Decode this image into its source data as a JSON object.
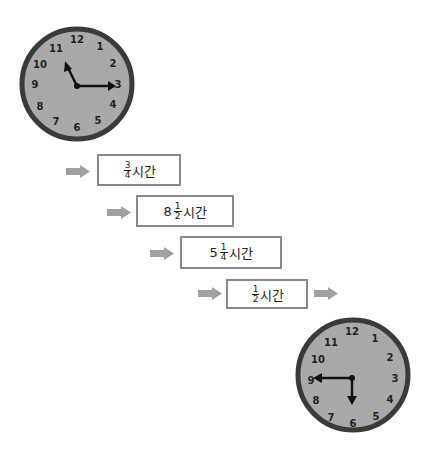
{
  "header": {
    "partial_text": "• •••• •••• ••• ••• ••••• ••••"
  },
  "colors": {
    "clock_face": "#a9a9a9",
    "clock_border": "#3a3a3a",
    "hand": "#111111",
    "arrow": "#a0a0a0",
    "box_border": "#8a8a8a"
  },
  "start_clock": {
    "numbers": [
      "12",
      "1",
      "2",
      "3",
      "4",
      "5",
      "6",
      "7",
      "8",
      "9",
      "10",
      "11"
    ],
    "time": "10:15"
  },
  "end_clock": {
    "numbers": [
      "12",
      "1",
      "2",
      "3",
      "4",
      "5",
      "6",
      "7",
      "8",
      "9",
      "10",
      "11"
    ],
    "time": "5:45"
  },
  "steps": [
    {
      "whole": "",
      "numerator": "3",
      "denominator": "4",
      "unit": "시간"
    },
    {
      "whole": "8",
      "numerator": "1",
      "denominator": "2",
      "unit": "시간"
    },
    {
      "whole": "5",
      "numerator": "1",
      "denominator": "4",
      "unit": "시간"
    },
    {
      "whole": "",
      "numerator": "1",
      "denominator": "2",
      "unit": "시간"
    }
  ]
}
